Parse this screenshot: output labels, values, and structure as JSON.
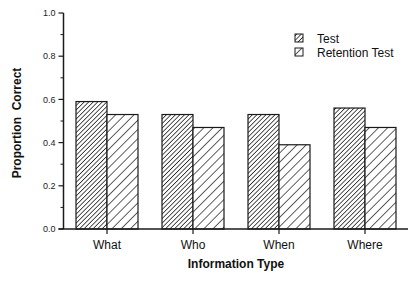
{
  "chart_data": {
    "type": "bar",
    "title": "",
    "xlabel": "Information Type",
    "ylabel": "Proportion  Correct",
    "ylim": [
      0.0,
      1.0
    ],
    "yticks": [
      "0.0",
      "0.2",
      "0.4",
      "0.6",
      "0.8",
      "1.0"
    ],
    "grid": false,
    "legend_position": "upper right",
    "categories": [
      "What",
      "Who",
      "When",
      "Where"
    ],
    "series": [
      {
        "name": "Test",
        "pattern": "dense-diagonal-hatch",
        "values": [
          0.59,
          0.53,
          0.53,
          0.56
        ]
      },
      {
        "name": "Retention Test",
        "pattern": "sparse-diagonal-hatch",
        "values": [
          0.53,
          0.47,
          0.39,
          0.47
        ]
      }
    ]
  },
  "legend": {
    "items": [
      {
        "label": "Test"
      },
      {
        "label": "Retention Test"
      }
    ]
  },
  "colors": {
    "ink": "#1a1a1a",
    "background": "#ffffff"
  }
}
